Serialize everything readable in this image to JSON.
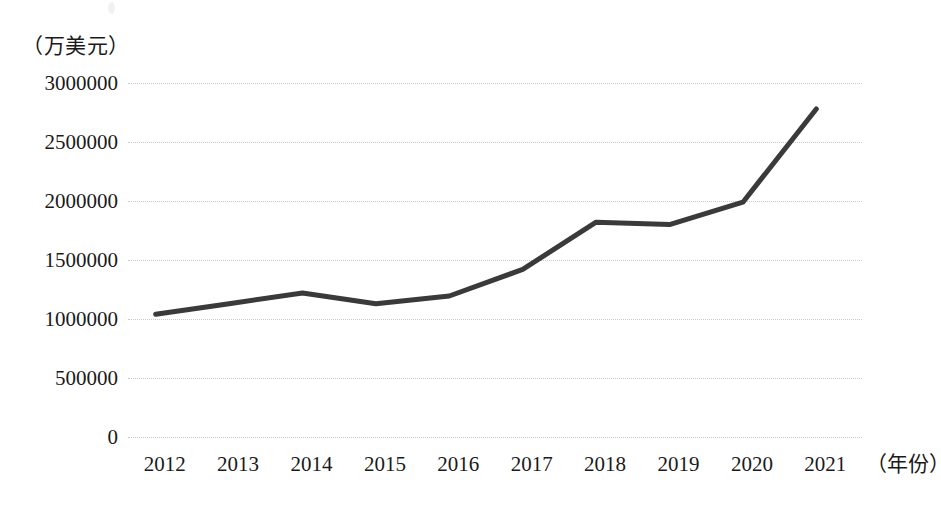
{
  "chart_data": {
    "type": "line",
    "title": "",
    "subtitle": "",
    "xlabel": "（年份）",
    "ylabel": "（万美元）",
    "categories": [
      "2012",
      "2013",
      "2014",
      "2015",
      "2016",
      "2017",
      "2018",
      "2019",
      "2020",
      "2021"
    ],
    "series": [
      {
        "name": "",
        "values": [
          1040000,
          1130000,
          1220000,
          1130000,
          1195000,
          1420000,
          1820000,
          1800000,
          1990000,
          2780000
        ]
      }
    ],
    "y_ticks": [
      0,
      500000,
      1000000,
      1500000,
      2000000,
      2500000,
      3000000
    ],
    "y_tick_labels": [
      "0",
      "500000",
      "1000000",
      "1500000",
      "2000000",
      "2500000",
      "3000000"
    ],
    "ylim": [
      0,
      3000000
    ],
    "grid": "horizontal-dotted",
    "legend": "none",
    "line_color": "#3a3a3a",
    "grid_color": "#c9c9c9",
    "background_color": "#ffffff"
  }
}
